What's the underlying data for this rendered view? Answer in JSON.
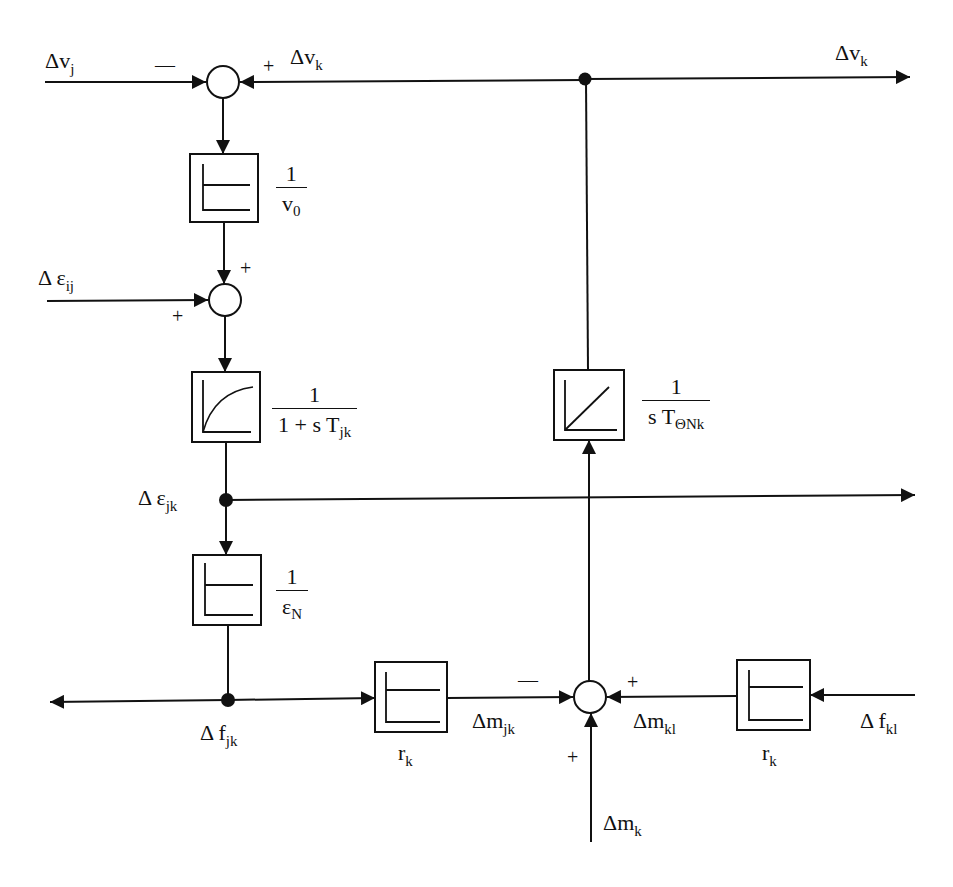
{
  "diagram": {
    "type": "block-diagram",
    "signals": {
      "dv_j": {
        "base": "Δv",
        "sub": "j"
      },
      "dv_k_in": {
        "base": "Δv",
        "sub": "k"
      },
      "dv_k_out": {
        "base": "Δv",
        "sub": "k"
      },
      "de_ij": {
        "base": "Δ ε",
        "sub": "ij"
      },
      "de_jk": {
        "base": "Δ ε",
        "sub": "jk"
      },
      "df_jk": {
        "base": "Δ f",
        "sub": "jk"
      },
      "dm_jk": {
        "base": "Δm",
        "sub": "jk"
      },
      "dm_kl": {
        "base": "Δm",
        "sub": "kl"
      },
      "df_kl": {
        "base": "Δ f",
        "sub": "kl"
      },
      "dm_k": {
        "base": "Δm",
        "sub": "k"
      }
    },
    "blocks": {
      "b1": {
        "num": "1",
        "den": "v",
        "den_sub": "0",
        "kind": "proportional"
      },
      "b2": {
        "num": "1",
        "den": "1 + s T",
        "den_sub": "jk",
        "kind": "first-order-lag"
      },
      "b3": {
        "num": "1",
        "den": "ε",
        "den_sub": "N",
        "kind": "proportional"
      },
      "b4": {
        "num": "1",
        "den": "s T",
        "den_sub": "ΘNk",
        "kind": "integrator"
      },
      "rk1": {
        "label": "r",
        "sub": "k",
        "kind": "proportional"
      },
      "rk2": {
        "label": "r",
        "sub": "k",
        "kind": "proportional"
      }
    },
    "signs": {
      "sum1_left": "—",
      "sum1_right": "+",
      "sum2_top": "+",
      "sum2_left": "+",
      "sum3_left": "—",
      "sum3_right": "+",
      "sum3_bottom": "+"
    },
    "colors": {
      "line": "#111111",
      "background": "#ffffff"
    }
  }
}
